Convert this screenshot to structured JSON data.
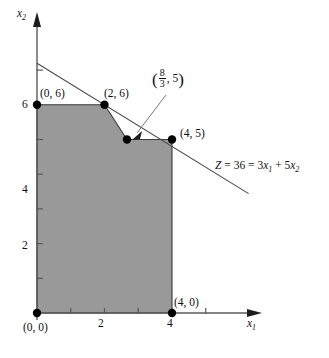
{
  "figure": {
    "type": "linear-programming-feasible-region",
    "axes": {
      "x_label": "x1",
      "x_label_base": "x",
      "x_label_sub": "1",
      "y_label_base": "x",
      "y_label_sub": "2",
      "x_ticks": [
        1,
        2,
        3,
        4
      ],
      "x_tick_labels": [
        "",
        "2",
        "",
        "4"
      ],
      "y_ticks": [
        1,
        2,
        3,
        4,
        5,
        6
      ],
      "y_tick_labels": [
        "",
        "2",
        "",
        "4",
        "",
        "6"
      ],
      "x_range": [
        0,
        6.6
      ],
      "y_range": [
        0,
        9.2
      ],
      "grid": false
    },
    "region": {
      "fill_color": "#999999",
      "vertices": [
        [
          0,
          0
        ],
        [
          0,
          6
        ],
        [
          2,
          6
        ],
        [
          2.6667,
          5
        ],
        [
          4,
          5
        ],
        [
          4,
          0
        ]
      ]
    },
    "points": [
      {
        "label": "(0, 0)",
        "x": 0,
        "y": 0
      },
      {
        "label": "(0, 6)",
        "x": 0,
        "y": 6
      },
      {
        "label": "(2, 6)",
        "x": 2,
        "y": 6
      },
      {
        "label": "(8/3, 5)",
        "x": 2.6667,
        "y": 5,
        "fraction": {
          "num": "8",
          "den": "3",
          "second": "5"
        }
      },
      {
        "label": "(4, 5)",
        "x": 4,
        "y": 5
      },
      {
        "label": "(4, 0)",
        "x": 4,
        "y": 0
      }
    ],
    "objective_line": {
      "text_parts": {
        "z": "Z",
        "eq1": " = 36 = 3",
        "v1": "x",
        "s1": "1",
        "plus": " + 5",
        "v2": "x",
        "s2": "2"
      },
      "full_text": "Z = 36 = 3x1 + 5x2",
      "from": [
        0,
        7.2
      ],
      "to": [
        6.27,
        3.44
      ],
      "slope": -0.6,
      "intercept": 7.2
    },
    "annotation_arrow": {
      "from_label": "(8/3, 5)",
      "to_point": [
        2.6667,
        5
      ]
    },
    "colors": {
      "region_fill": "#999999",
      "line": "#444444",
      "axis": "#555555",
      "point": "#000000",
      "text": "#111111"
    }
  }
}
